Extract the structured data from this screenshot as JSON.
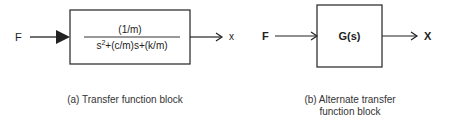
{
  "diagram_a": {
    "input_label": "F",
    "numerator": "(1/m)",
    "denominator_base": "s",
    "denominator_exp": "2",
    "denominator_rest": "+(c/m)s+(k/m)",
    "output_label": "x",
    "caption": "(a) Transfer function block"
  },
  "diagram_b": {
    "input_label": "F",
    "block_label": "G(s)",
    "output_label": "X",
    "caption_line1": "(b) Alternate transfer",
    "caption_line2": "function block"
  }
}
